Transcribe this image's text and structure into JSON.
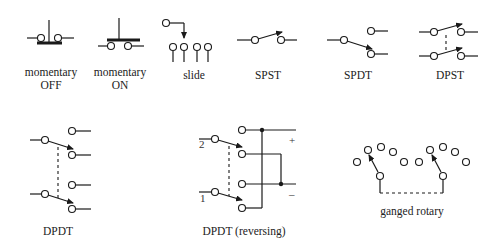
{
  "diagram": {
    "labels": {
      "momentary_off_1": "momentary",
      "momentary_off_2": "OFF",
      "momentary_on_1": "momentary",
      "momentary_on_2": "ON",
      "slide": "slide",
      "spst": "SPST",
      "spdt": "SPDT",
      "dpst": "DPST",
      "dpdt": "DPDT",
      "dpdt_reversing": "DPDT (reversing)",
      "ganged_rotary": "ganged rotary"
    },
    "annotations": {
      "input_2": "2",
      "input_1": "1",
      "plus": "+",
      "minus": "–"
    },
    "colors": {
      "line": "#1a1a1a",
      "background": "#ffffff"
    }
  }
}
